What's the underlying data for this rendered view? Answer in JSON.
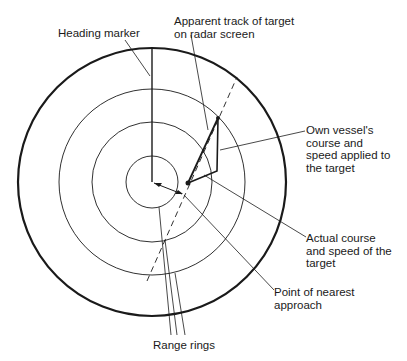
{
  "labels": {
    "heading_marker": "Heading marker",
    "apparent_track": "Apparent track of target\non radar screen",
    "own_vessel": "Own vessel's\ncourse and\nspeed applied to\nthe target",
    "actual_course": "Actual course\nand speed of the\ntarget",
    "nearest_approach": "Point of nearest\napproach",
    "range_rings": "Range rings"
  },
  "geometry": {
    "center": [
      152,
      182
    ],
    "outer_radius": 134,
    "ring_radii": [
      26,
      60,
      93
    ],
    "colors": {
      "line": "#1a1a1a",
      "background": "#ffffff"
    }
  }
}
